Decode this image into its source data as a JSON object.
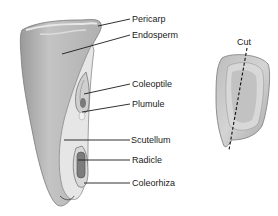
{
  "figure": {
    "labels": [
      {
        "id": "pericarp",
        "text": "Pericarp",
        "x": 132,
        "y": 14
      },
      {
        "id": "endosperm",
        "text": "Endosperm",
        "x": 132,
        "y": 30
      },
      {
        "id": "coleoptile",
        "text": "Coleoptile",
        "x": 132,
        "y": 79
      },
      {
        "id": "plumule",
        "text": "Plumule",
        "x": 132,
        "y": 99
      },
      {
        "id": "scutellum",
        "text": "Scutellum",
        "x": 130,
        "y": 135
      },
      {
        "id": "radicle",
        "text": "Radicle",
        "x": 132,
        "y": 155
      },
      {
        "id": "coleorhiza",
        "text": "Coleorhiza",
        "x": 132,
        "y": 177
      }
    ],
    "cut_label": {
      "text": "Cut",
      "x": 237,
      "y": 36
    }
  },
  "colors": {
    "leader_line": "#1a1a1a",
    "kernel_shade": "#b9b9b9",
    "kernel_light": "#e2e2e2",
    "kernel_dark": "#8a8a8a"
  }
}
